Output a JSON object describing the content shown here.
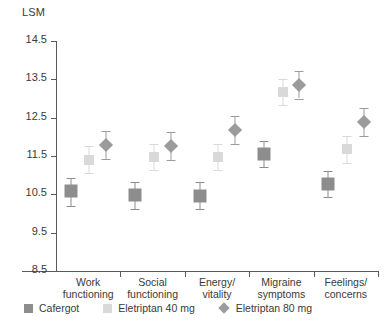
{
  "chart_data": {
    "type": "scatter",
    "title": "",
    "subtitle": "",
    "xlabel": "",
    "ylabel": "LSM",
    "ylim": [
      8.5,
      14.5
    ],
    "ytick_step": 1.0,
    "yticks": [
      "14.5",
      "13.5",
      "12.5",
      "11.5",
      "10.5",
      "9.5",
      "8.5"
    ],
    "ytick_values": [
      14.5,
      13.5,
      12.5,
      11.5,
      10.5,
      9.5,
      8.5
    ],
    "grid": false,
    "legend_position": "bottom-left",
    "error_bars": "vertical, capped",
    "categories": [
      "Work functioning",
      "Social functioning",
      "Energy/ vitality",
      "Migraine symptoms",
      "Feelings/ concerns"
    ],
    "category_lines": [
      [
        "Work",
        "functioning"
      ],
      [
        "Social",
        "functioning"
      ],
      [
        "Energy/",
        "vitality"
      ],
      [
        "Migraine",
        "symptoms"
      ],
      [
        "Feelings/",
        "concerns"
      ]
    ],
    "series": [
      {
        "name": "Cafergot",
        "marker": "square",
        "color": "#8d8d8d",
        "values": [
          10.58,
          10.47,
          10.46,
          11.55,
          10.78
        ],
        "err_low": [
          10.19,
          10.11,
          10.11,
          11.21,
          10.42
        ],
        "err_high": [
          10.92,
          10.82,
          10.83,
          11.88,
          11.12
        ]
      },
      {
        "name": "Eletriptan 40 mg",
        "marker": "square",
        "color": "#d9d9d9",
        "values": [
          11.4,
          11.48,
          11.47,
          13.17,
          11.68
        ],
        "err_low": [
          11.05,
          11.14,
          11.13,
          12.82,
          11.32
        ],
        "err_high": [
          11.76,
          11.82,
          11.81,
          13.51,
          12.03
        ]
      },
      {
        "name": "Eletriptan 80 mg",
        "marker": "diamond",
        "color": "#9b9b9b",
        "values": [
          11.78,
          11.77,
          12.18,
          13.36,
          12.38
        ],
        "err_low": [
          11.43,
          11.4,
          11.82,
          13.0,
          12.02
        ],
        "err_high": [
          12.14,
          12.13,
          12.54,
          13.72,
          12.75
        ]
      }
    ]
  },
  "legend": {
    "items": [
      {
        "label": "Cafergot",
        "swatch": "square",
        "color": "#8d8d8d"
      },
      {
        "label": "Eletriptan 40 mg",
        "swatch": "square",
        "color": "#d9d9d9"
      },
      {
        "label": "Eletriptan 80 mg",
        "swatch": "diamond",
        "color": "#9b9b9b"
      }
    ]
  },
  "colors": {
    "axis": "#5a5a5a",
    "text": "#3a3a3a",
    "background": "#ffffff",
    "cafergot": "#8d8d8d",
    "eletriptan40": "#d9d9d9",
    "eletriptan80": "#9b9b9b"
  }
}
